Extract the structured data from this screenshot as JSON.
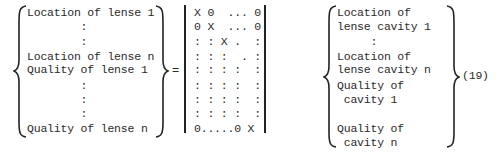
{
  "equation": {
    "number": "(19)",
    "equals_sign": "=",
    "left_vector": {
      "rows": [
        {
          "y": 7,
          "text": "Location of lense 1"
        },
        {
          "y": 21,
          "text": "        :"
        },
        {
          "y": 36,
          "text": "        :"
        },
        {
          "y": 51,
          "text": "Location of lense n"
        },
        {
          "y": 64,
          "text": "Quality of lense 1"
        },
        {
          "y": 80,
          "text": "        :"
        },
        {
          "y": 94,
          "text": "        :"
        },
        {
          "y": 108,
          "text": "        :"
        },
        {
          "y": 123,
          "text": "Quality of lense n"
        }
      ]
    },
    "matrix": {
      "rows": [
        {
          "y": 7,
          "text": "X 0  ... 0"
        },
        {
          "y": 21,
          "text": "0 X  ... 0"
        },
        {
          "y": 36,
          "text": ": : X .  :"
        },
        {
          "y": 51,
          "text": ": : :  . :"
        },
        {
          "y": 64,
          "text": ": : : :  :"
        },
        {
          "y": 80,
          "text": ": : : :  :"
        },
        {
          "y": 94,
          "text": ": : : :  :"
        },
        {
          "y": 108,
          "text": ": : : :  :"
        },
        {
          "y": 123,
          "text": "0.....0 X"
        }
      ]
    },
    "right_vector": {
      "rows": [
        {
          "y": 7,
          "text": "Location of"
        },
        {
          "y": 21,
          "text": "lense cavity 1"
        },
        {
          "y": 36,
          "text": "     :"
        },
        {
          "y": 51,
          "text": "Location of"
        },
        {
          "y": 64,
          "text": "lense cavity n"
        },
        {
          "y": 80,
          "text": "Quality of"
        },
        {
          "y": 94,
          "text": " cavity 1"
        },
        {
          "y": 123,
          "text": "Quality of"
        },
        {
          "y": 137,
          "text": " cavity n"
        }
      ]
    }
  }
}
